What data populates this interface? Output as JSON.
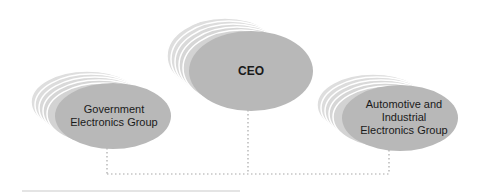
{
  "diagram": {
    "type": "org-chart",
    "colors": {
      "ellipse_fill": "#b8b8b8",
      "ellipse_stack_fill": "#dcdcdc",
      "ellipse_stack_stroke": "#ffffff",
      "connector": "#a8a8a8",
      "text": "#1a1a1a"
    },
    "nodes": [
      {
        "id": "ceo",
        "lines": [
          "CEO"
        ],
        "bold": true
      },
      {
        "id": "gov",
        "lines": [
          "Government",
          "Electronics Group"
        ],
        "bold": false
      },
      {
        "id": "auto",
        "lines": [
          "Automotive and",
          "Industrial",
          "Electronics Group"
        ],
        "bold": false
      }
    ],
    "edges": [
      {
        "from": "ceo",
        "to": "gov",
        "style": "dotted"
      },
      {
        "from": "ceo",
        "to": "auto",
        "style": "dotted"
      }
    ]
  }
}
